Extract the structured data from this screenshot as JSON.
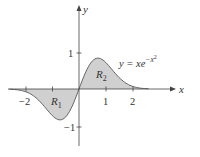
{
  "chart_data": {
    "type": "area",
    "title": "",
    "function_label": "y = xe^{-x^2}",
    "xlabel": "x",
    "ylabel": "y",
    "x_ticks": [
      -2,
      -1,
      1,
      2
    ],
    "x_tick_labels": [
      "−2",
      "1",
      "2"
    ],
    "y_ticks": [
      1,
      -1
    ],
    "y_tick_labels": [
      "1",
      "−1"
    ],
    "xlim": [
      -2.8,
      3.7
    ],
    "ylim": [
      -1.5,
      2.3
    ],
    "regions": [
      {
        "name": "R1",
        "label": "R",
        "subscript": "1",
        "x_range": [
          -2.6,
          0
        ],
        "sign": "negative"
      },
      {
        "name": "R2",
        "label": "R",
        "subscript": "2",
        "x_range": [
          0,
          2.6
        ],
        "sign": "positive"
      }
    ],
    "x": [
      -2.6,
      -2,
      -1.5,
      -1,
      -0.707,
      -0.5,
      0,
      0.5,
      0.707,
      1,
      1.5,
      2,
      2.6
    ],
    "values": [
      -0.003,
      -0.037,
      -0.158,
      -0.368,
      -0.429,
      -0.389,
      0,
      0.389,
      0.429,
      0.368,
      0.158,
      0.037,
      0.003
    ],
    "grid": false,
    "colors": {
      "fill": "#cfcfcf",
      "curve": "#555555",
      "axis": "#444444"
    }
  },
  "labels": {
    "x_axis": "x",
    "y_axis": "y",
    "eq_prefix": "y = ",
    "eq_x": "xe",
    "eq_exp": "−x",
    "eq_exp2": "2",
    "r1": "R",
    "r1_sub": "1",
    "r2": "R",
    "r2_sub": "2",
    "xt_m2": "−2",
    "xt_1": "1",
    "xt_2": "2",
    "yt_1": "1",
    "yt_m1": "−1"
  }
}
